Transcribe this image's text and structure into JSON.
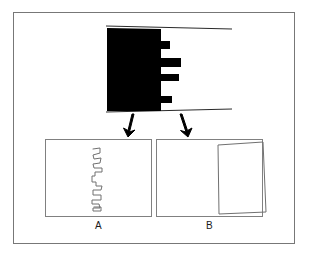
{
  "figure": {
    "background_color": "#ffffff",
    "frame_color": "#777777",
    "ink_color": "#000000",
    "line_color": "#808080"
  },
  "stimulus": {
    "name": "comb-silhouette",
    "fill_color": "#000000",
    "has_top_rule": true,
    "has_bottom_rule": true,
    "notch_count": 4
  },
  "arrows": {
    "left": {
      "name": "arrow-to-panel-a",
      "direction": "down-left",
      "color": "#000000"
    },
    "right": {
      "name": "arrow-to-panel-b",
      "direction": "down-right",
      "color": "#000000"
    }
  },
  "panels": [
    {
      "id": "a",
      "label": "A",
      "content_name": "zigzag-contour-drawing",
      "stroke_color": "#707070",
      "border_color": "#808080"
    },
    {
      "id": "b",
      "label": "B",
      "content_name": "tilted-rectangle-drawing",
      "stroke_color": "#707070",
      "border_color": "#808080"
    }
  ]
}
